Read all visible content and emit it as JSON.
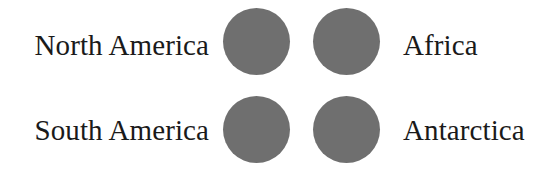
{
  "canvas": {
    "width": 552,
    "height": 175,
    "background_color": "#ffffff"
  },
  "style": {
    "circle_color": "#6f6f6f",
    "text_color": "#1a1a1a"
  },
  "diagram": {
    "type": "matching-pairs",
    "rows": [
      {
        "left_label": "North America",
        "right_label": "Africa",
        "left_circle": "filled-gray-circle",
        "right_circle": "filled-gray-circle"
      },
      {
        "left_label": "South America",
        "right_label": "Antarctica",
        "left_circle": "filled-gray-circle",
        "right_circle": "filled-gray-circle"
      }
    ]
  }
}
